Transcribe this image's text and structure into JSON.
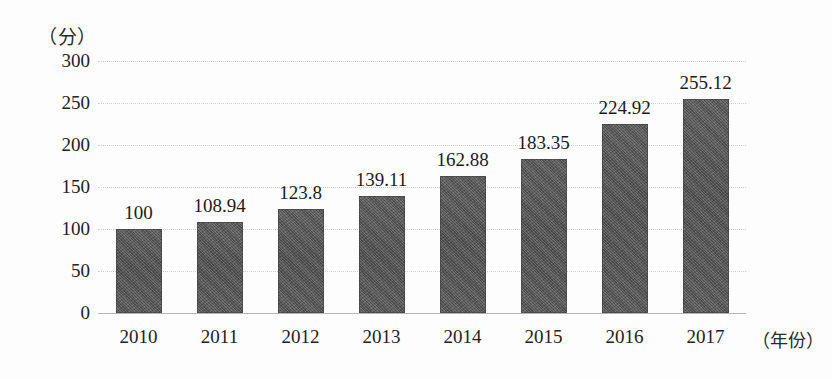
{
  "chart_data": {
    "type": "bar",
    "title": "",
    "subtitle": "",
    "xlabel": "（年份）",
    "ylabel": "（分）",
    "categories": [
      "2010",
      "2011",
      "2012",
      "2013",
      "2014",
      "2015",
      "2016",
      "2017"
    ],
    "values": [
      100,
      108.94,
      123.8,
      139.11,
      162.88,
      183.35,
      224.92,
      255.12
    ],
    "value_labels": [
      "100",
      "108.94",
      "123.8",
      "139.11",
      "162.88",
      "183.35",
      "224.92",
      "255.12"
    ],
    "series": [
      {
        "name": "",
        "values": [
          100,
          108.94,
          123.8,
          139.11,
          162.88,
          183.35,
          224.92,
          255.12
        ]
      }
    ],
    "ylim": [
      0,
      300
    ],
    "yticks": [
      0,
      50,
      100,
      150,
      200,
      250,
      300
    ],
    "ytick_labels": [
      "0",
      "50",
      "100",
      "150",
      "200",
      "250",
      "300"
    ],
    "xlim_categories": 8,
    "grid": true,
    "grid_axis": "y",
    "grid_style": "dotted",
    "legend": false,
    "legend_position": "none",
    "data_labels": true,
    "bar_color": "#565656",
    "grid_color": "#c8c8c8",
    "axis_color": "#b4b4b4",
    "background_color": "#fdfdfd",
    "text_color": "#1d1d1d"
  }
}
